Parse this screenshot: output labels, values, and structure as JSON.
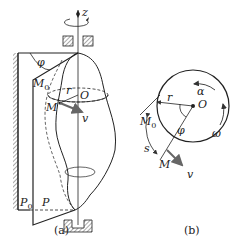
{
  "figure_a": {
    "caption": "(a)",
    "labels": {
      "axis": "z",
      "angle": "φ",
      "m0": "M",
      "m0_sub": "0",
      "m": "M",
      "r": "r",
      "o": "O",
      "v": "v",
      "p0": "P",
      "p0_sub": "0",
      "p": "P"
    }
  },
  "figure_b": {
    "caption": "(b)",
    "labels": {
      "alpha": "α",
      "omega": "ω",
      "m0": "M",
      "m0_sub": "0",
      "r": "r",
      "o": "O",
      "phi": "φ",
      "s": "s",
      "m": "M",
      "v": "v"
    }
  }
}
